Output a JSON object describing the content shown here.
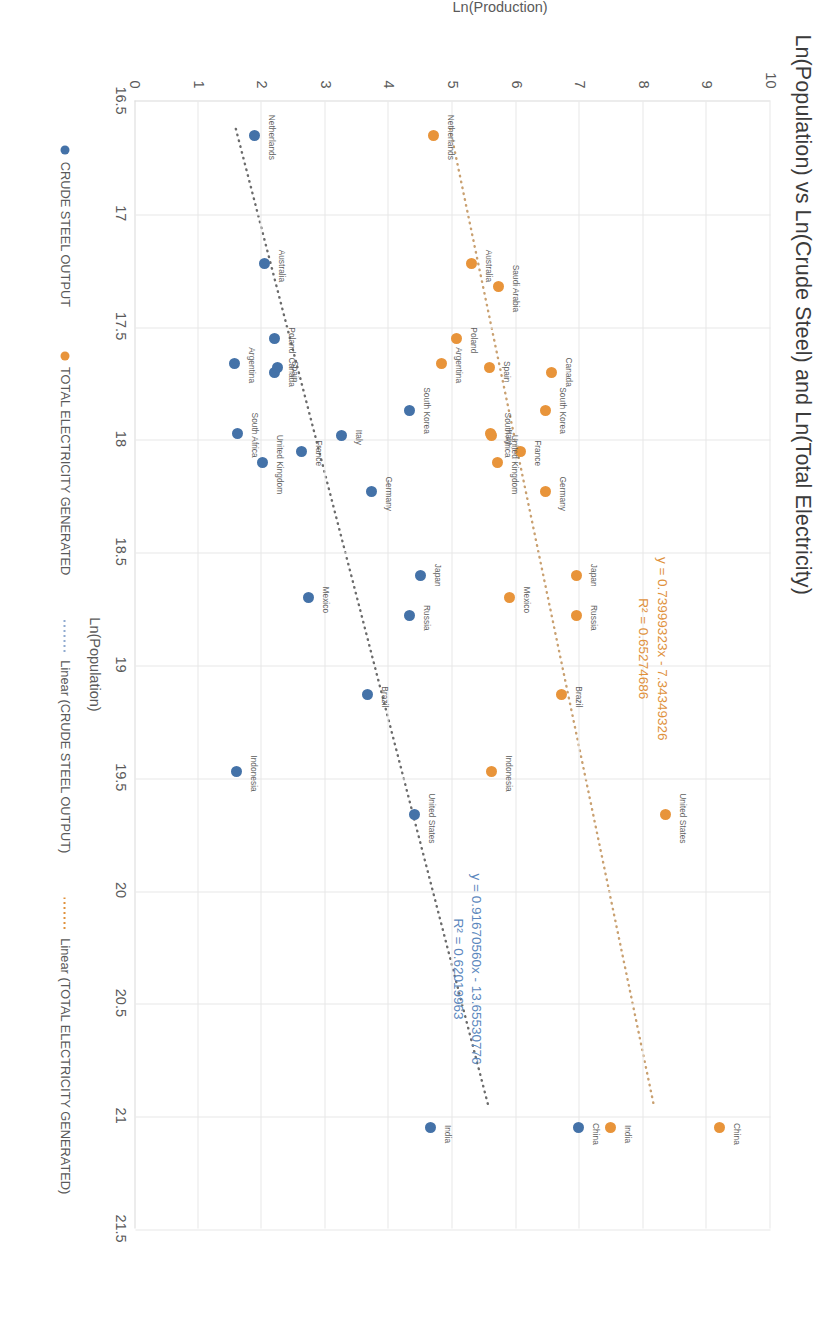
{
  "chart_data": {
    "type": "scatter",
    "title": "Ln(Population) vs Ln(Crude Steel) and Ln(Total Electricity)",
    "xlabel": "Ln(Population)",
    "ylabel": "Ln(Production)",
    "xlim": [
      16.5,
      21.5
    ],
    "ylim": [
      0,
      10
    ],
    "xticks": [
      "16.5",
      "17",
      "17.5",
      "18",
      "18.5",
      "19",
      "19.5",
      "20",
      "20.5",
      "21",
      "21.5"
    ],
    "yticks": [
      "0",
      "1",
      "2",
      "3",
      "4",
      "5",
      "6",
      "7",
      "8",
      "9",
      "10"
    ],
    "grid": true,
    "legend_position": "bottom",
    "colors": {
      "crude_steel": "#4472a8",
      "total_electricity": "#e8943a",
      "trend_electricity": "#e0913c",
      "trend_steel": "#8faad0",
      "gridline": "#e8e8e8"
    },
    "series": [
      {
        "name": "CRUDE STEEL OUTPUT",
        "color": "#4472a8",
        "points": [
          {
            "label": "China",
            "x": 21.05,
            "y": 6.98,
            "lx": 6,
            "ly": -4
          },
          {
            "label": "India",
            "x": 21.05,
            "y": 4.66,
            "lx": 6,
            "ly": -4
          },
          {
            "label": "United States",
            "x": 19.66,
            "y": 4.4,
            "lx": 4,
            "ly": -4
          },
          {
            "label": "Brazil",
            "x": 19.13,
            "y": 3.67,
            "lx": 2,
            "ly": -4
          },
          {
            "label": "Russia",
            "x": 18.78,
            "y": 4.33,
            "lx": 2,
            "ly": -4
          },
          {
            "label": "Japan",
            "x": 18.6,
            "y": 4.5,
            "lx": 0,
            "ly": -4
          },
          {
            "label": "Germany",
            "x": 18.23,
            "y": 3.73,
            "lx": 2,
            "ly": -4
          },
          {
            "label": "Indonesia",
            "x": 19.47,
            "y": 1.6,
            "lx": 2,
            "ly": -4
          },
          {
            "label": "Mexico",
            "x": 18.7,
            "y": 2.73,
            "lx": 2,
            "ly": -4
          },
          {
            "label": "South Korea",
            "x": 17.87,
            "y": 4.32,
            "lx": 0,
            "ly": -4
          },
          {
            "label": "Italy",
            "x": 17.98,
            "y": 3.25,
            "lx": 2,
            "ly": -4
          },
          {
            "label": "France",
            "x": 18.05,
            "y": 2.62,
            "lx": 2,
            "ly": -4
          },
          {
            "label": "United Kingdom",
            "x": 18.1,
            "y": 2.02,
            "lx": 2,
            "ly": -4
          },
          {
            "label": "South Africa",
            "x": 17.97,
            "y": 1.62,
            "lx": 2,
            "ly": -4
          },
          {
            "label": "Canada",
            "x": 17.7,
            "y": 2.2,
            "lx": 0,
            "ly": -4
          },
          {
            "label": "Spain",
            "x": 17.68,
            "y": 2.25,
            "lx": 4,
            "ly": -4
          },
          {
            "label": "Argentina",
            "x": 17.66,
            "y": 1.58,
            "lx": 2,
            "ly": -4
          },
          {
            "label": "Poland",
            "x": 17.55,
            "y": 2.2,
            "lx": 2,
            "ly": -4
          },
          {
            "label": "Australia",
            "x": 17.22,
            "y": 2.05,
            "lx": 2,
            "ly": -4
          },
          {
            "label": "Netherlands",
            "x": 16.65,
            "y": 1.88,
            "lx": 2,
            "ly": -4
          }
        ]
      },
      {
        "name": "TOTAL ELECTRICITY GENERATED",
        "color": "#e8943a",
        "points": [
          {
            "label": "China",
            "x": 21.05,
            "y": 9.2,
            "lx": 6,
            "ly": -4
          },
          {
            "label": "India",
            "x": 21.05,
            "y": 7.48,
            "lx": 6,
            "ly": -4
          },
          {
            "label": "United States",
            "x": 19.66,
            "y": 8.35,
            "lx": 4,
            "ly": -4
          },
          {
            "label": "Brazil",
            "x": 19.13,
            "y": 6.72,
            "lx": 2,
            "ly": -4
          },
          {
            "label": "Russia",
            "x": 18.78,
            "y": 6.95,
            "lx": 2,
            "ly": -4
          },
          {
            "label": "Japan",
            "x": 18.6,
            "y": 6.95,
            "lx": 0,
            "ly": -4
          },
          {
            "label": "Germany",
            "x": 18.23,
            "y": 6.47,
            "lx": 2,
            "ly": -4
          },
          {
            "label": "Indonesia",
            "x": 19.47,
            "y": 5.62,
            "lx": 2,
            "ly": -4
          },
          {
            "label": "Mexico",
            "x": 18.7,
            "y": 5.9,
            "lx": 2,
            "ly": -4
          },
          {
            "label": "South Korea",
            "x": 17.87,
            "y": 6.47,
            "lx": 0,
            "ly": -4
          },
          {
            "label": "Italy",
            "x": 17.98,
            "y": 5.62,
            "lx": 2,
            "ly": -4
          },
          {
            "label": "France",
            "x": 18.05,
            "y": 6.07,
            "lx": 2,
            "ly": -4
          },
          {
            "label": "United Kingdom",
            "x": 18.1,
            "y": 5.7,
            "lx": 2,
            "ly": -4
          },
          {
            "label": "South Africa",
            "x": 17.97,
            "y": 5.6,
            "lx": 2,
            "ly": -4
          },
          {
            "label": "Canada",
            "x": 17.7,
            "y": 6.55,
            "lx": 0,
            "ly": -4
          },
          {
            "label": "Spain",
            "x": 17.68,
            "y": 5.58,
            "lx": 4,
            "ly": -4
          },
          {
            "label": "Argentina",
            "x": 17.66,
            "y": 4.82,
            "lx": 2,
            "ly": -4
          },
          {
            "label": "Poland",
            "x": 17.55,
            "y": 5.06,
            "lx": 2,
            "ly": -4
          },
          {
            "label": "Saudi Arabia",
            "x": 17.32,
            "y": 5.72,
            "lx": 2,
            "ly": -4
          },
          {
            "label": "Australia",
            "x": 17.22,
            "y": 5.3,
            "lx": 2,
            "ly": -4
          },
          {
            "label": "Netherlands",
            "x": 16.65,
            "y": 4.7,
            "lx": 2,
            "ly": -4
          }
        ]
      }
    ],
    "trendlines": [
      {
        "name": "Linear (TOTAL ELECTRICITY GENERATED)",
        "color": "#c9a070",
        "slope": 0.73999323,
        "intercept": -7.34349326,
        "r2": 0.65274686,
        "x_start": 16.62,
        "x_end": 20.96,
        "equation": "y = 0.73999323x - 7.34349326",
        "r2_text": "R² = 0.65274686"
      },
      {
        "name": "Linear (CRUDE STEEL OUTPUT)",
        "color": "#6b6b6b",
        "slope": 0.9167056,
        "intercept": -13.65530776,
        "r2": 0.62019963,
        "x_start": 16.62,
        "x_end": 20.96,
        "equation": "y = 0.91670560x - 13.65530776",
        "r2_text": "R² = 0.62019963"
      }
    ],
    "annotations": [
      {
        "id": "eq-electricity",
        "line1": "y = 0.73999323x - 7.34349326",
        "line2": "R² = 0.65274686",
        "color": "#e0913c"
      },
      {
        "id": "eq-steel",
        "line1": "y = 0.91670560x - 13.65530776",
        "line2": "R² = 0.62019963",
        "color": "#5b87bd"
      }
    ],
    "legend": [
      {
        "label": "CRUDE STEEL OUTPUT",
        "type": "marker",
        "color": "#4472a8"
      },
      {
        "label": "TOTAL ELECTRICITY GENERATED",
        "type": "marker",
        "color": "#e8943a"
      },
      {
        "label": "Linear (CRUDE STEEL OUTPUT)",
        "type": "line",
        "color": "#8faad0"
      },
      {
        "label": "Linear (TOTAL ELECTRICITY GENERATED)",
        "type": "line",
        "color": "#e0913c"
      }
    ]
  }
}
